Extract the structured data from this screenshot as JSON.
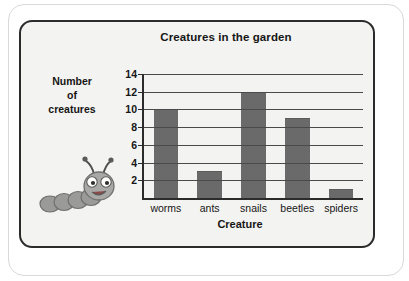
{
  "card": {
    "title": "Creatures in the garden",
    "y_axis_title_line1": "Number",
    "y_axis_title_line2": "of",
    "y_axis_title_line3": "creatures",
    "x_axis_title": "Creature",
    "mascot_icon": "caterpillar-icon"
  },
  "colors": {
    "bar_fill": "#6a6a6a",
    "axis": "#2b2b2b",
    "gridline": "#4a4a4a",
    "card_background": "#f3f3f1",
    "text": "#161616"
  },
  "chart_data": {
    "type": "bar",
    "title": "Creatures in the garden",
    "xlabel": "Creature",
    "ylabel": "Number of creatures",
    "categories": [
      "worms",
      "ants",
      "snails",
      "beetles",
      "spiders"
    ],
    "values": [
      10,
      3,
      12,
      9,
      1
    ],
    "ylim": [
      0,
      14
    ],
    "yticks": [
      2,
      4,
      6,
      8,
      10,
      12,
      14
    ],
    "ytick_labels": [
      "2",
      "4",
      "6",
      "8",
      "10",
      "12",
      "14"
    ],
    "grid": true,
    "legend": false,
    "bar_color": "#6a6a6a"
  }
}
